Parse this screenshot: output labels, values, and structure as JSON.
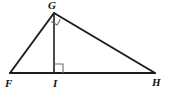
{
  "figure": {
    "background_color": "#ffffff",
    "stroke_color": "#1c1c1c",
    "altitude_color": "#2a2a2a",
    "angle_mark_color": "#6e6e6e",
    "width": 172,
    "height": 95,
    "labels": {
      "apex": "G",
      "left_base": "F",
      "foot": "I",
      "right_base": "H"
    },
    "vertices": [
      {
        "name": "G",
        "x": 54,
        "y": 13
      },
      {
        "name": "F",
        "x": 10,
        "y": 73
      },
      {
        "name": "I",
        "x": 54,
        "y": 73
      },
      {
        "name": "H",
        "x": 155,
        "y": 73
      }
    ],
    "segments": [
      {
        "name": "FG",
        "from": "F",
        "to": "G"
      },
      {
        "name": "GH",
        "from": "G",
        "to": "H"
      },
      {
        "name": "FH",
        "from": "F",
        "to": "H"
      },
      {
        "name": "GI",
        "from": "G",
        "to": "I"
      }
    ],
    "right_angles": [
      {
        "at": "I",
        "between": "GI and FH"
      },
      {
        "at": "G",
        "between": "GF and GH"
      }
    ]
  }
}
